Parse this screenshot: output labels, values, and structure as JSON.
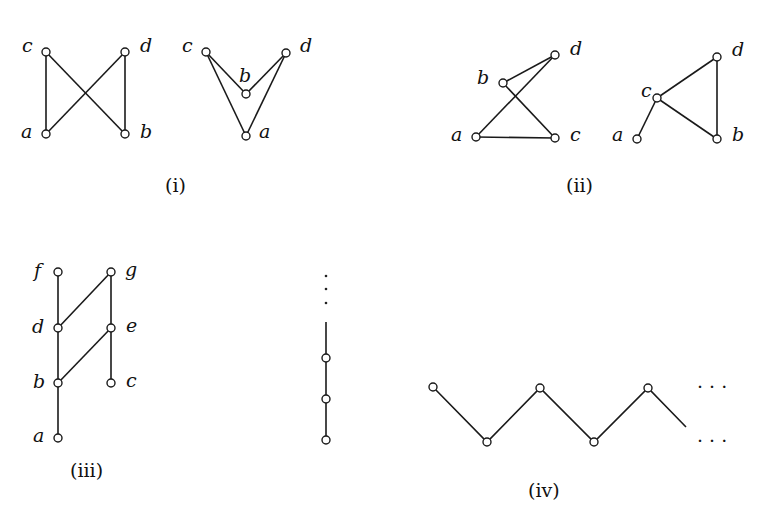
{
  "figures": [
    {
      "id": "i",
      "caption": "(i)",
      "graphs": [
        {
          "nodes": [
            {
              "name": "c",
              "x": 46,
              "y": 52
            },
            {
              "name": "d",
              "x": 125,
              "y": 52
            },
            {
              "name": "a",
              "x": 46,
              "y": 134
            },
            {
              "name": "b",
              "x": 125,
              "y": 134
            }
          ],
          "edges": [
            [
              "a",
              "c"
            ],
            [
              "a",
              "d"
            ],
            [
              "b",
              "c"
            ],
            [
              "b",
              "d"
            ]
          ]
        },
        {
          "nodes": [
            {
              "name": "c",
              "x": 206,
              "y": 52
            },
            {
              "name": "d",
              "x": 286,
              "y": 53,
              "label": "d"
            },
            {
              "name": "b",
              "x": 246,
              "y": 94
            },
            {
              "name": "a",
              "x": 246,
              "y": 136
            }
          ],
          "edges": [
            [
              "a",
              "c"
            ],
            [
              "a",
              "d"
            ],
            [
              "b",
              "c"
            ],
            [
              "b",
              "d"
            ]
          ]
        }
      ]
    },
    {
      "id": "ii",
      "caption": "(ii)",
      "graphs": [
        {
          "nodes": [
            {
              "name": "b",
              "x": 503,
              "y": 83
            },
            {
              "name": "d",
              "x": 555,
              "y": 55
            },
            {
              "name": "a",
              "x": 476,
              "y": 137
            },
            {
              "name": "c",
              "x": 555,
              "y": 138
            }
          ],
          "edges": [
            [
              "a",
              "c"
            ],
            [
              "a",
              "d"
            ],
            [
              "b",
              "d"
            ],
            [
              "b",
              "c"
            ]
          ]
        },
        {
          "nodes": [
            {
              "name": "c",
              "x": 657,
              "y": 98
            },
            {
              "name": "d",
              "x": 717,
              "y": 57
            },
            {
              "name": "a",
              "x": 637,
              "y": 139
            },
            {
              "name": "b",
              "x": 717,
              "y": 139
            }
          ],
          "edges": [
            [
              "a",
              "c"
            ],
            [
              "c",
              "d"
            ],
            [
              "c",
              "b"
            ],
            [
              "b",
              "d"
            ]
          ]
        }
      ]
    },
    {
      "id": "iii",
      "caption": "(iii)",
      "nodes": [
        {
          "name": "f",
          "x": 58,
          "y": 272
        },
        {
          "name": "g",
          "x": 111,
          "y": 272
        },
        {
          "name": "d",
          "x": 58,
          "y": 328
        },
        {
          "name": "e",
          "x": 111,
          "y": 328
        },
        {
          "name": "b",
          "x": 58,
          "y": 383
        },
        {
          "name": "c",
          "x": 111,
          "y": 383
        },
        {
          "name": "a",
          "x": 58,
          "y": 438
        }
      ],
      "edges": [
        [
          "a",
          "b"
        ],
        [
          "b",
          "d"
        ],
        [
          "d",
          "f"
        ],
        [
          "c",
          "e"
        ],
        [
          "e",
          "g"
        ],
        [
          "b",
          "e"
        ],
        [
          "d",
          "g"
        ]
      ]
    },
    {
      "id": "chain",
      "caption": "",
      "nodes_y": [
        358,
        399,
        440
      ],
      "x": 326,
      "ellipsis": "⋮"
    },
    {
      "id": "iv",
      "caption": "(iv)",
      "top_nodes": [
        [
          433,
          387
        ],
        [
          540,
          388
        ],
        [
          648,
          388
        ]
      ],
      "bottom_nodes": [
        [
          487,
          442
        ],
        [
          594,
          442
        ]
      ],
      "ellipsis_top": "· · ·",
      "ellipsis_bottom": "· · ·"
    }
  ],
  "labels": {
    "i_left": {
      "c": "c",
      "d": "d",
      "a": "a",
      "b": "b"
    },
    "i_right": {
      "c": "c",
      "d": "d",
      "b": "b",
      "a": "a"
    },
    "ii_left": {
      "b": "b",
      "d": "d",
      "a": "a",
      "c": "c"
    },
    "ii_right": {
      "c": "c",
      "d": "d",
      "a": "a",
      "b": "b"
    },
    "iii": {
      "f": "f",
      "g": "g",
      "d": "d",
      "e": "e",
      "b": "b",
      "c": "c",
      "a": "a"
    }
  },
  "captions": {
    "i": "(i)",
    "ii": "(ii)",
    "iii": "(iii)",
    "iv": "(iv)"
  },
  "ellipsis": {
    "iv_top": "· · ·",
    "iv_bottom": "· · ·"
  }
}
